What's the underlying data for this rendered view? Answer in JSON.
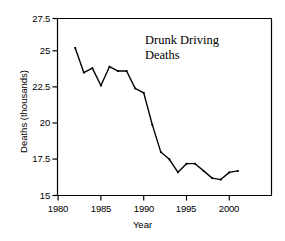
{
  "chart_data": {
    "type": "line",
    "title": "Drunk Driving Deaths",
    "title_line1": "Drunk Driving",
    "title_line2": "Deaths",
    "xlabel": "Year",
    "ylabel": "Deaths (thousands)",
    "xlim": [
      1979.0,
      1804.0
    ],
    "x_range": [
      1979.0,
      2004.0
    ],
    "ylim": [
      15,
      27.5
    ],
    "grid": false,
    "legend": null,
    "xticks": [
      1980,
      1985,
      1990,
      1995,
      2000
    ],
    "xtick_labels": [
      "1980",
      "1985",
      "1990",
      "1995",
      "2000"
    ],
    "yticks": [
      15,
      17.5,
      20,
      22.5,
      25,
      27.5
    ],
    "ytick_labels": [
      "15",
      "17.5",
      "20",
      "22.5",
      "25",
      "27.5"
    ],
    "line_color": "#000000",
    "x": [
      1982,
      1983,
      1984,
      1985,
      1986,
      1987,
      1988,
      1989,
      1990,
      1991,
      1992,
      1993,
      1994,
      1995,
      1996,
      1997,
      1998,
      1999,
      2000,
      2001
    ],
    "values": [
      25.2,
      23.5,
      23.8,
      22.6,
      23.9,
      23.6,
      23.6,
      22.4,
      22.1,
      19.9,
      18.0,
      17.5,
      16.6,
      17.2,
      17.2,
      16.7,
      16.2,
      16.1,
      16.6,
      16.7
    ],
    "series": [
      {
        "name": "Drunk Driving Deaths",
        "values": [
          25.2,
          23.5,
          23.8,
          22.6,
          23.9,
          23.6,
          23.6,
          22.4,
          22.1,
          19.9,
          18.0,
          17.5,
          16.6,
          17.2,
          17.2,
          16.7,
          16.2,
          16.1,
          16.6,
          16.7
        ]
      }
    ]
  }
}
